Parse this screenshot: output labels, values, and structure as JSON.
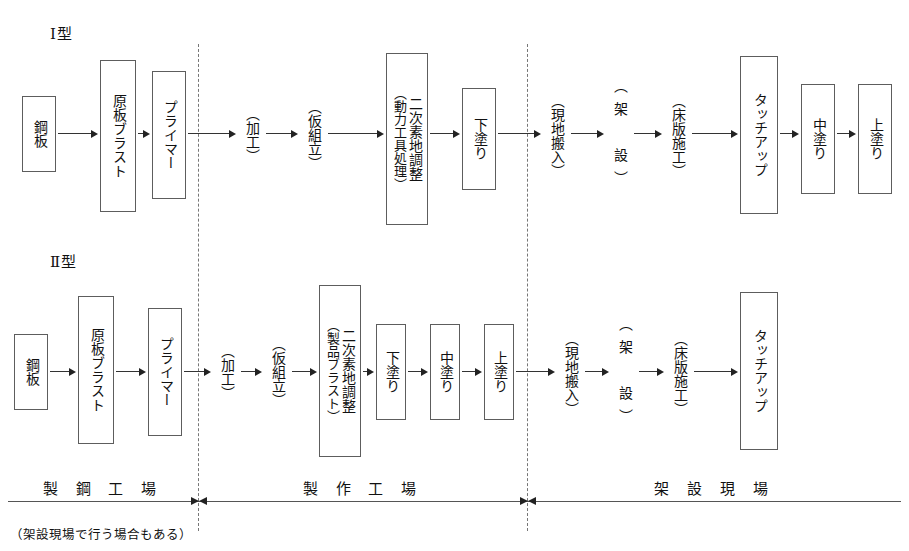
{
  "diagram": {
    "title_row1": "Ⅰ型",
    "title_row2": "Ⅱ型",
    "row1": {
      "nodes": [
        {
          "label": "鋼板",
          "annot": "",
          "boxed": true,
          "wide": false
        },
        {
          "label": "原板ブラスト",
          "annot": "",
          "boxed": true,
          "wide": false
        },
        {
          "label": "プライマー",
          "annot": "",
          "boxed": true,
          "wide": false
        },
        {
          "label": "（加工）",
          "annot": "",
          "boxed": false,
          "wide": false
        },
        {
          "label": "（仮組立）",
          "annot": "",
          "boxed": false,
          "wide": false
        },
        {
          "label": "二次素地調整",
          "annot": "（動力工具処理）",
          "boxed": true,
          "wide": false
        },
        {
          "label": "下塗り",
          "annot": "",
          "boxed": true,
          "wide": false
        },
        {
          "label": "（現地搬入）",
          "annot": "",
          "boxed": false,
          "wide": false
        },
        {
          "label": "（架　設）",
          "annot": "",
          "boxed": false,
          "wide": true
        },
        {
          "label": "（床版施工）",
          "annot": "",
          "boxed": false,
          "wide": false
        },
        {
          "label": "タッチアップ",
          "annot": "",
          "boxed": true,
          "wide": false
        },
        {
          "label": "中塗り",
          "annot": "",
          "boxed": true,
          "wide": false
        },
        {
          "label": "上塗り",
          "annot": "",
          "boxed": true,
          "wide": false
        }
      ]
    },
    "row2": {
      "nodes": [
        {
          "label": "鋼板",
          "annot": "",
          "boxed": true,
          "wide": false
        },
        {
          "label": "原板ブラスト",
          "annot": "",
          "boxed": true,
          "wide": false
        },
        {
          "label": "プライマー",
          "annot": "",
          "boxed": true,
          "wide": false
        },
        {
          "label": "（加工）",
          "annot": "",
          "boxed": false,
          "wide": false
        },
        {
          "label": "（仮組立）",
          "annot": "",
          "boxed": false,
          "wide": false
        },
        {
          "label": "二次素地調整",
          "annot": "（製品ブラスト）",
          "boxed": true,
          "wide": false
        },
        {
          "label": "下塗り",
          "annot": "",
          "boxed": true,
          "wide": false
        },
        {
          "label": "中塗り",
          "annot": "",
          "boxed": true,
          "wide": false
        },
        {
          "label": "上塗り",
          "annot": "",
          "boxed": true,
          "wide": false
        },
        {
          "label": "（現地搬入）",
          "annot": "",
          "boxed": false,
          "wide": false
        },
        {
          "label": "（架　設）",
          "annot": "",
          "boxed": false,
          "wide": true
        },
        {
          "label": "（床版施工）",
          "annot": "",
          "boxed": false,
          "wide": false
        },
        {
          "label": "タッチアップ",
          "annot": "",
          "boxed": true,
          "wide": false
        }
      ]
    },
    "zones": [
      {
        "label": "製 鋼 工 場"
      },
      {
        "label": "製 作 工 場"
      },
      {
        "label": "架 設 現 場"
      }
    ],
    "footnote": "（架設現場で行う場合もある）",
    "colors": {
      "box_border": "#5d5d5d",
      "line": "#333333",
      "dashed": "#777777",
      "text": "#111111",
      "background": "#ffffff"
    }
  }
}
